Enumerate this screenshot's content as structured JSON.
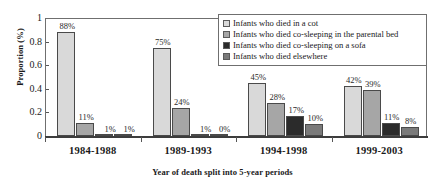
{
  "chart_data": {
    "type": "bar",
    "title": "",
    "xlabel": "Year of death split into 5-year periods",
    "ylabel": "Proportion (%)",
    "categories": [
      "1984-1988",
      "1989-1993",
      "1994-1998",
      "1999-2003"
    ],
    "ylim": [
      0,
      1
    ],
    "y_ticks": [
      "0",
      "0.2",
      "0.4",
      "0.6",
      "0.8",
      "1"
    ],
    "grid": false,
    "legend_position": "top-right",
    "series": [
      {
        "name": "Infants who died in a cot",
        "color": "#d9d9d9",
        "values": [
          0.88,
          0.75,
          0.45,
          0.42
        ],
        "labels": [
          "88%",
          "75%",
          "45%",
          "42%"
        ]
      },
      {
        "name": "Infants who died co-sleeping in the parental bed",
        "color": "#a6a6a6",
        "values": [
          0.11,
          0.24,
          0.28,
          0.39
        ],
        "labels": [
          "11%",
          "24%",
          "28%",
          "39%"
        ]
      },
      {
        "name": "Infants who died co-sleeping on a sofa",
        "color": "#2b2b2b",
        "values": [
          0.01,
          0.01,
          0.17,
          0.11
        ],
        "labels": [
          "1%",
          "1%",
          "17%",
          "11%"
        ]
      },
      {
        "name": "Infants who died elsewhere",
        "color": "#7a7a7a",
        "values": [
          0.01,
          0.0,
          0.1,
          0.08
        ],
        "labels": [
          "1%",
          "0%",
          "10%",
          "8%"
        ]
      }
    ]
  }
}
